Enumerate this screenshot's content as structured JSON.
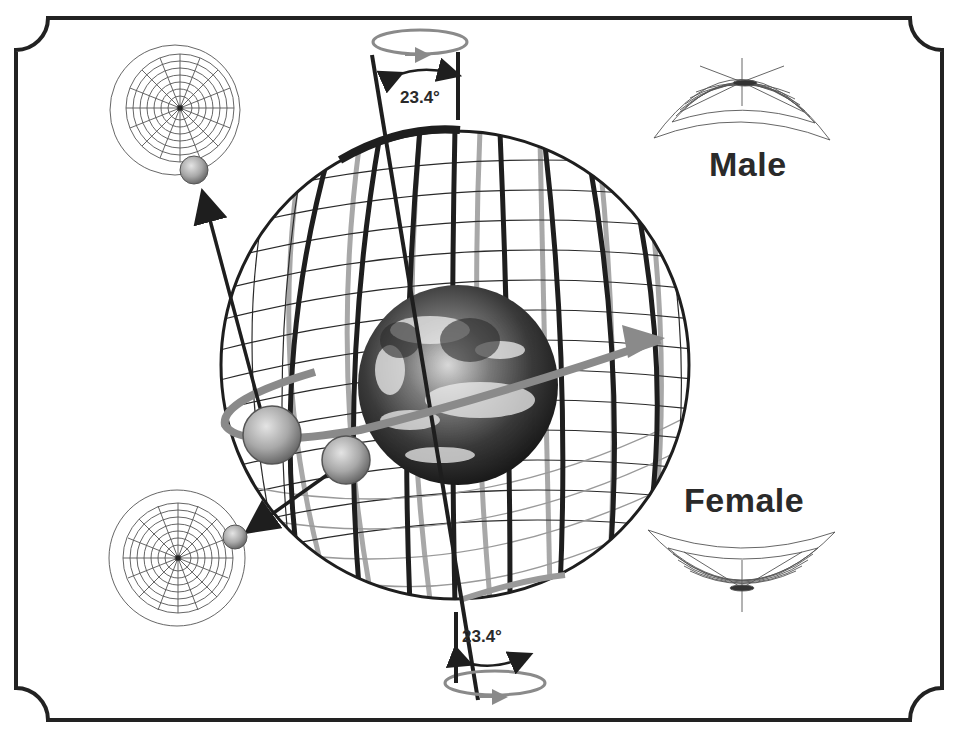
{
  "diagram": {
    "title": "",
    "labels": {
      "top_angle": "23.4°",
      "bottom_angle": "23.4°",
      "male": "Male",
      "female": "Female"
    },
    "colors": {
      "frame": "#222222",
      "dark_lines": "#1e1e1e",
      "gray_lines": "#9a9a9a",
      "orbit_band": "#8a8a8a",
      "text": "#2a2a2a",
      "background": "#ffffff"
    },
    "elements": [
      "decorative-frame",
      "wireframe-celestial-sphere",
      "earth-image",
      "axial-tilt-indicator-top",
      "axial-tilt-indicator-bottom",
      "moon-orbit-band",
      "moon-1",
      "moon-2",
      "polar-grid-top-left",
      "polar-grid-bottom-left",
      "male-saddle-grid",
      "female-saddle-grid"
    ]
  }
}
